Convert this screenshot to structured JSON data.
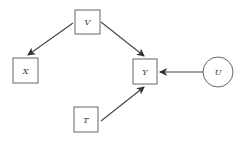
{
  "diagram": {
    "type": "causal-graph",
    "nodes": [
      {
        "id": "V",
        "label": "V",
        "shape": "box",
        "observed": true
      },
      {
        "id": "X",
        "label": "X",
        "shape": "box",
        "observed": true
      },
      {
        "id": "Y",
        "label": "Y",
        "shape": "box",
        "observed": true
      },
      {
        "id": "T",
        "label": "T",
        "shape": "box",
        "observed": true
      },
      {
        "id": "U",
        "label": "U",
        "shape": "circle",
        "observed": false
      }
    ],
    "edges": [
      {
        "from": "V",
        "to": "X"
      },
      {
        "from": "V",
        "to": "Y"
      },
      {
        "from": "T",
        "to": "Y"
      },
      {
        "from": "U",
        "to": "Y"
      }
    ],
    "colors": {
      "stroke": "#555555",
      "arrow": "#333333"
    }
  }
}
